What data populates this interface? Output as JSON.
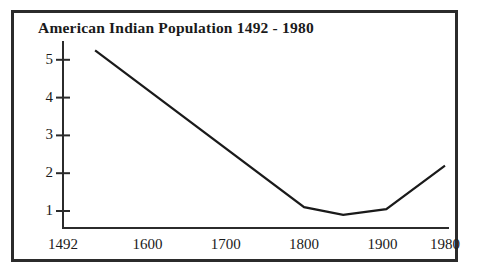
{
  "figure": {
    "background_color": "#ffffff",
    "frame_color": "#2b2b2b",
    "ink_color": "#1a1a1a"
  },
  "chart_data": {
    "type": "line",
    "title": "American Indian Population 1492 - 1980",
    "xlabel": "",
    "ylabel": "",
    "grid": false,
    "legend": false,
    "xlim": [
      1492,
      1980
    ],
    "ylim": [
      0.55,
      5.5
    ],
    "xticks": [
      1492,
      1600,
      1700,
      1800,
      1900,
      1980
    ],
    "xtick_labels": [
      "1492",
      "1600",
      "1700",
      "1800",
      "1900",
      "1980"
    ],
    "yticks": [
      1,
      2,
      3,
      4,
      5
    ],
    "ytick_labels": [
      "1",
      "2",
      "3",
      "4",
      "5"
    ],
    "series": [
      {
        "name": "American Indian population",
        "x": [
          1533,
          1800,
          1850,
          1905,
          1980
        ],
        "values": [
          5.25,
          1.1,
          0.9,
          1.05,
          2.2
        ]
      }
    ]
  }
}
